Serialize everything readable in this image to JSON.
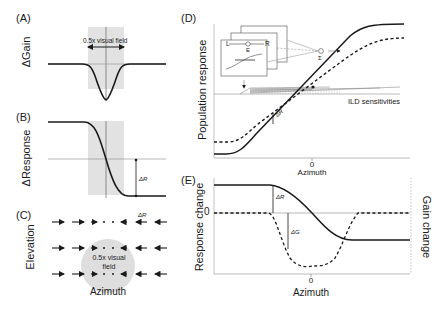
{
  "panels": {
    "A": {
      "label": "(A)",
      "ylabel": "ΔGain",
      "annotation": "0.5x visual field"
    },
    "B": {
      "label": "(B)",
      "ylabel": "ΔResponse",
      "delta_label": "ΔR"
    },
    "C": {
      "label": "(C)",
      "ylabel": "Elevation",
      "xlabel": "Azimuth",
      "delta_label": "ΔR",
      "field_label_line1": "0.5x visual",
      "field_label_line2": "field"
    },
    "D": {
      "label": "(D)",
      "ylabel": "Population response",
      "xlabel": "Azimuth",
      "xtick_zero": "0",
      "annotation": "ILD sensitivities",
      "delta_label": "ΔR",
      "inset": {
        "left_label": "L",
        "right_label": "R",
        "plus_label": "+",
        "minus_label": "−",
        "node_label": "E",
        "sum_label": "Σ"
      }
    },
    "E": {
      "label": "(E)",
      "ylabel_left": "Response change",
      "ylabel_right": "Gain change",
      "xlabel": "Azimuth",
      "xtick_zero": "0",
      "ytick_zero": "0",
      "delta_r_label": "ΔR",
      "delta_g_label": "ΔG"
    }
  },
  "colors": {
    "curve": "#1a1a1a",
    "axis": "#888888",
    "shade": "#e0e0e0",
    "circle": "#dcdcdc"
  }
}
